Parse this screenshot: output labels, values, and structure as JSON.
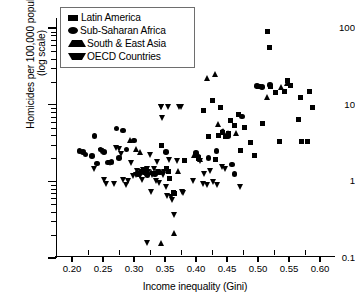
{
  "chart_data": {
    "type": "scatter",
    "title": "",
    "xlabel": "Income inequality (Gini)",
    "ylabel_line1": "Homicides per 100,000 population",
    "ylabel_line2": "(log scale)",
    "yscale": "log",
    "xlim": [
      0.188,
      0.615
    ],
    "ylim": [
      0.1,
      100
    ],
    "xticks": [
      "0.20",
      "0.25",
      "0.30",
      "0.35",
      "0.40",
      "0.45",
      "0.50",
      "0.55",
      "0.60"
    ],
    "xtick_values": [
      0.2,
      0.25,
      0.3,
      0.35,
      0.4,
      0.45,
      0.5,
      0.55,
      0.6
    ],
    "yticks": [
      "100",
      "10",
      "1",
      "0.1"
    ],
    "ytick_values": [
      100,
      10,
      1,
      0.1
    ],
    "grid": false,
    "legend_position": "upper-left-inside",
    "legend": [
      {
        "label": "Latin America",
        "marker": "square"
      },
      {
        "label": "Sub-Saharan Africa",
        "marker": "circle"
      },
      {
        "label": "South & East Asia",
        "marker": "triangle-up"
      },
      {
        "label": "OECD Countries",
        "marker": "triangle-down"
      }
    ],
    "series": [
      {
        "name": "Latin America",
        "marker": "square",
        "points": [
          [
            0.345,
            2.9
          ],
          [
            0.352,
            1.45
          ],
          [
            0.356,
            1.35
          ],
          [
            0.358,
            1.1
          ],
          [
            0.363,
            0.72
          ],
          [
            0.366,
            0.7
          ],
          [
            0.382,
            1.85
          ],
          [
            0.404,
            2.0
          ],
          [
            0.412,
            8.3
          ],
          [
            0.42,
            3.9
          ],
          [
            0.427,
            11.3
          ],
          [
            0.432,
            1.9
          ],
          [
            0.437,
            4.0
          ],
          [
            0.44,
            9.2
          ],
          [
            0.443,
            4.4
          ],
          [
            0.447,
            3.8
          ],
          [
            0.452,
            4.2
          ],
          [
            0.455,
            6.3
          ],
          [
            0.462,
            5.4
          ],
          [
            0.468,
            7.5
          ],
          [
            0.472,
            2.55
          ],
          [
            0.478,
            5.0
          ],
          [
            0.488,
            3.2
          ],
          [
            0.494,
            2.2
          ],
          [
            0.5,
            17.0
          ],
          [
            0.508,
            5.6
          ],
          [
            0.516,
            90.0
          ],
          [
            0.518,
            55.0
          ],
          [
            0.52,
            17.5
          ],
          [
            0.528,
            14.5
          ],
          [
            0.535,
            3.3
          ],
          [
            0.542,
            15.0
          ],
          [
            0.548,
            20.5
          ],
          [
            0.552,
            18.0
          ],
          [
            0.565,
            6.4
          ],
          [
            0.568,
            12.5
          ],
          [
            0.57,
            3.3
          ],
          [
            0.58,
            3.3
          ],
          [
            0.583,
            15.0
          ],
          [
            0.588,
            9.2
          ]
        ]
      },
      {
        "name": "Sub-Saharan Africa",
        "marker": "circle",
        "points": [
          [
            0.212,
            2.5
          ],
          [
            0.218,
            2.4
          ],
          [
            0.222,
            2.25
          ],
          [
            0.232,
            2.15
          ],
          [
            0.236,
            3.9
          ],
          [
            0.24,
            1.7
          ],
          [
            0.246,
            2.6
          ],
          [
            0.252,
            2.4
          ],
          [
            0.258,
            1.75
          ],
          [
            0.264,
            1.8
          ],
          [
            0.272,
            4.9
          ],
          [
            0.276,
            2.0
          ],
          [
            0.282,
            4.6
          ],
          [
            0.288,
            2.6
          ],
          [
            0.3,
            3.4
          ],
          [
            0.306,
            1.25
          ],
          [
            0.316,
            1.3
          ],
          [
            0.322,
            1.2
          ],
          [
            0.334,
            1.25
          ],
          [
            0.342,
            1.3
          ],
          [
            0.352,
            2.4
          ],
          [
            0.4,
            2.35
          ],
          [
            0.404,
            2.1
          ],
          [
            0.42,
            2.0
          ],
          [
            0.433,
            2.5
          ],
          [
            0.443,
            4.4
          ],
          [
            0.452,
            3.9
          ],
          [
            0.458,
            1.65
          ],
          [
            0.462,
            1.25
          ],
          [
            0.474,
            7.0
          ],
          [
            0.498,
            17.5
          ],
          [
            0.506,
            17.0
          ],
          [
            0.519,
            18.0
          ]
        ]
      },
      {
        "name": "South & East Asia",
        "marker": "triangle-up",
        "points": [
          [
            0.294,
            3.4
          ],
          [
            0.304,
            2.6
          ],
          [
            0.31,
            2.4
          ],
          [
            0.318,
            1.35
          ],
          [
            0.328,
            1.3
          ],
          [
            0.336,
            1.3
          ],
          [
            0.345,
            0.155
          ],
          [
            0.366,
            0.21
          ],
          [
            0.372,
            1.35
          ],
          [
            0.398,
            2.2
          ],
          [
            0.408,
            1.95
          ],
          [
            0.418,
            22.0
          ],
          [
            0.432,
            25.0
          ],
          [
            0.436,
            5.6
          ],
          [
            0.444,
            4.5
          ],
          [
            0.452,
            4.3
          ],
          [
            0.466,
            4.2
          ],
          [
            0.515,
            12.5
          ],
          [
            0.538,
            17.0
          ],
          [
            0.547,
            19.0
          ]
        ]
      },
      {
        "name": "OECD Countries",
        "marker": "triangle-down",
        "points": [
          [
            0.236,
            1.45
          ],
          [
            0.247,
            2.45
          ],
          [
            0.252,
            1.05
          ],
          [
            0.256,
            0.92
          ],
          [
            0.262,
            1.75
          ],
          [
            0.268,
            0.92
          ],
          [
            0.272,
            2.7
          ],
          [
            0.276,
            2.6
          ],
          [
            0.28,
            2.25
          ],
          [
            0.284,
            1.05
          ],
          [
            0.288,
            0.88
          ],
          [
            0.292,
            1.0
          ],
          [
            0.296,
            1.7
          ],
          [
            0.3,
            1.15
          ],
          [
            0.304,
            1.2
          ],
          [
            0.306,
            1.35
          ],
          [
            0.308,
            1.25
          ],
          [
            0.31,
            1.15
          ],
          [
            0.312,
            1.3
          ],
          [
            0.313,
            1.3
          ],
          [
            0.314,
            1.05
          ],
          [
            0.316,
            1.4
          ],
          [
            0.317,
            1.3
          ],
          [
            0.318,
            1.25
          ],
          [
            0.32,
            1.35
          ],
          [
            0.321,
            1.2
          ],
          [
            0.322,
            1.45
          ],
          [
            0.322,
            0.155
          ],
          [
            0.324,
            1.3
          ],
          [
            0.326,
            2.2
          ],
          [
            0.328,
            0.72
          ],
          [
            0.33,
            1.2
          ],
          [
            0.332,
            1.25
          ],
          [
            0.334,
            1.45
          ],
          [
            0.336,
            1.0
          ],
          [
            0.338,
            1.8
          ],
          [
            0.34,
            1.3
          ],
          [
            0.342,
            0.95
          ],
          [
            0.344,
            9.3
          ],
          [
            0.345,
            9.4
          ],
          [
            0.346,
            6.7
          ],
          [
            0.348,
            1.2
          ],
          [
            0.35,
            1.3
          ],
          [
            0.352,
            0.85
          ],
          [
            0.354,
            0.64
          ],
          [
            0.356,
            9.4
          ],
          [
            0.358,
            1.9
          ],
          [
            0.36,
            0.62
          ],
          [
            0.362,
            0.57
          ],
          [
            0.366,
            0.36
          ],
          [
            0.37,
            1.85
          ],
          [
            0.374,
            9.3
          ],
          [
            0.376,
            9.2
          ],
          [
            0.378,
            0.72
          ],
          [
            0.38,
            0.7
          ],
          [
            0.396,
            1.0
          ],
          [
            0.404,
            2.0
          ],
          [
            0.408,
            1.85
          ],
          [
            0.412,
            0.92
          ],
          [
            0.414,
            1.25
          ],
          [
            0.418,
            0.88
          ],
          [
            0.424,
            1.35
          ],
          [
            0.428,
            0.98
          ],
          [
            0.435,
            0.9
          ],
          [
            0.443,
            1.55
          ],
          [
            0.448,
            1.45
          ],
          [
            0.472,
            0.83
          ]
        ]
      }
    ]
  }
}
